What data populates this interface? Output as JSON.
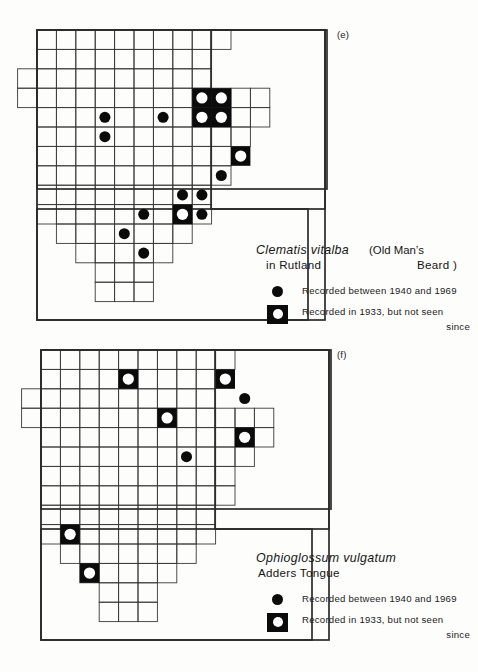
{
  "page": {
    "background": "#fdfdfc",
    "ink": "#141414",
    "grid_line_color": "#3a3a3a",
    "outline_color": "#2b2b2b",
    "symbol_fill": "#0b0b0b",
    "symbol_hole": "#ffffff"
  },
  "maps": [
    {
      "id": "e",
      "tag": "(e)",
      "cell": 19.4,
      "origin": {
        "x": 37,
        "y": 30
      },
      "outer_box": {
        "x": 37,
        "y": 30,
        "w": 288,
        "h": 290
      },
      "legend": {
        "species": "Clematis  vitalba",
        "species_suffix": "(Old Man’s",
        "sub_left": "in Rutland",
        "sub_right": "Beard )",
        "key_dot_label": "Recorded between 1940 and 1969",
        "key_box_label": "Recorded in 1933, but not seen",
        "key_box_label_cont": "since"
      },
      "grid_rows": [
        {
          "row": 0,
          "col_start": 0,
          "col_end": 10
        },
        {
          "row": 1,
          "col_start": 0,
          "col_end": 9
        },
        {
          "row": 2,
          "col_start": -1,
          "col_end": 9
        },
        {
          "row": 3,
          "col_start": -1,
          "col_end": 12
        },
        {
          "row": 4,
          "col_start": 0,
          "col_end": 12
        },
        {
          "row": 5,
          "col_start": 0,
          "col_end": 11
        },
        {
          "row": 6,
          "col_start": 0,
          "col_end": 10
        },
        {
          "row": 7,
          "col_start": 0,
          "col_end": 10
        },
        {
          "row": 8,
          "col_start": 0,
          "col_end": 9
        },
        {
          "row": 9,
          "col_start": 0,
          "col_end": 9
        },
        {
          "row": 10,
          "col_start": 1,
          "col_end": 8
        },
        {
          "row": 11,
          "col_start": 2,
          "col_end": 7
        },
        {
          "row": 12,
          "col_start": 3,
          "col_end": 6
        },
        {
          "row": 13,
          "col_start": 3,
          "col_end": 6
        }
      ],
      "region_outlines": [
        {
          "x": 37,
          "y": 30,
          "w": 288,
          "h": 290
        },
        {
          "x": 37,
          "y": 30,
          "w": 290,
          "h": 159
        },
        {
          "x": 37,
          "y": 209,
          "w": 271,
          "h": 111
        },
        {
          "x": 211,
          "y": 30,
          "w": 114,
          "h": 179
        }
      ],
      "symbols": [
        {
          "type": "dot",
          "col": 3,
          "row": 4
        },
        {
          "type": "dot",
          "col": 3,
          "row": 5
        },
        {
          "type": "dot",
          "col": 6,
          "row": 4
        },
        {
          "type": "box",
          "col": 8,
          "row": 3
        },
        {
          "type": "box",
          "col": 9,
          "row": 3
        },
        {
          "type": "box",
          "col": 8,
          "row": 4
        },
        {
          "type": "box",
          "col": 9,
          "row": 4
        },
        {
          "type": "box",
          "col": 10,
          "row": 6
        },
        {
          "type": "dot",
          "col": 9,
          "row": 7
        },
        {
          "type": "dot",
          "col": 7,
          "row": 8
        },
        {
          "type": "dot",
          "col": 8,
          "row": 8
        },
        {
          "type": "dot",
          "col": 5,
          "row": 9
        },
        {
          "type": "box",
          "col": 7,
          "row": 9
        },
        {
          "type": "dot",
          "col": 8,
          "row": 9
        },
        {
          "type": "dot",
          "col": 4,
          "row": 10
        },
        {
          "type": "dot",
          "col": 5,
          "row": 11
        }
      ]
    },
    {
      "id": "f",
      "tag": "(f)",
      "cell": 19.4,
      "origin": {
        "x": 41,
        "y": 14
      },
      "outer_box": {
        "x": 41,
        "y": 14,
        "w": 288,
        "h": 290
      },
      "legend": {
        "species": "Ophioglossum  vulgatum",
        "species_suffix": "",
        "sub_left": "Adders Tongue",
        "sub_right": "",
        "key_dot_label": "Recorded between 1940 and 1969",
        "key_box_label": "Recorded in 1933, but not seen",
        "key_box_label_cont": "since"
      },
      "grid_rows": [
        {
          "row": 0,
          "col_start": 0,
          "col_end": 10
        },
        {
          "row": 1,
          "col_start": 0,
          "col_end": 9
        },
        {
          "row": 2,
          "col_start": -1,
          "col_end": 9
        },
        {
          "row": 3,
          "col_start": -1,
          "col_end": 12
        },
        {
          "row": 4,
          "col_start": 0,
          "col_end": 12
        },
        {
          "row": 5,
          "col_start": 0,
          "col_end": 11
        },
        {
          "row": 6,
          "col_start": 0,
          "col_end": 10
        },
        {
          "row": 7,
          "col_start": 0,
          "col_end": 10
        },
        {
          "row": 8,
          "col_start": 0,
          "col_end": 9
        },
        {
          "row": 9,
          "col_start": 0,
          "col_end": 9
        },
        {
          "row": 10,
          "col_start": 1,
          "col_end": 8
        },
        {
          "row": 11,
          "col_start": 2,
          "col_end": 7
        },
        {
          "row": 12,
          "col_start": 3,
          "col_end": 6
        },
        {
          "row": 13,
          "col_start": 3,
          "col_end": 6
        }
      ],
      "region_outlines": [
        {
          "x": 41,
          "y": 14,
          "w": 288,
          "h": 290
        },
        {
          "x": 41,
          "y": 14,
          "w": 290,
          "h": 159
        },
        {
          "x": 41,
          "y": 193,
          "w": 271,
          "h": 111
        },
        {
          "x": 215,
          "y": 14,
          "w": 114,
          "h": 179
        }
      ],
      "symbols": [
        {
          "type": "box",
          "col": 4,
          "row": 1
        },
        {
          "type": "box",
          "col": 9,
          "row": 1
        },
        {
          "type": "dot",
          "col": 10,
          "row": 2
        },
        {
          "type": "box",
          "col": 6,
          "row": 3
        },
        {
          "type": "box",
          "col": 10,
          "row": 4
        },
        {
          "type": "dot",
          "col": 7,
          "row": 5
        },
        {
          "type": "box",
          "col": 1,
          "row": 9
        },
        {
          "type": "box",
          "col": 2,
          "row": 11
        }
      ]
    }
  ],
  "chart_data": {
    "type": "map",
    "panels": [
      {
        "label": "(e)",
        "species": "Clematis vitalba",
        "common_name": "Old Man’s Beard",
        "area": "in Rutland",
        "records_1940_1969": 9,
        "records_1933_not_seen": 5,
        "legend_entries": [
          "Recorded between 1940 and 1969",
          "Recorded in 1933, but not seen since"
        ]
      },
      {
        "label": "(f)",
        "species": "Ophioglossum vulgatum",
        "common_name": "Adders Tongue",
        "area": "in Rutland",
        "records_1940_1969": 2,
        "records_1933_not_seen": 6,
        "legend_entries": [
          "Recorded between 1940 and 1969",
          "Recorded in 1933, but not seen since"
        ]
      }
    ]
  }
}
